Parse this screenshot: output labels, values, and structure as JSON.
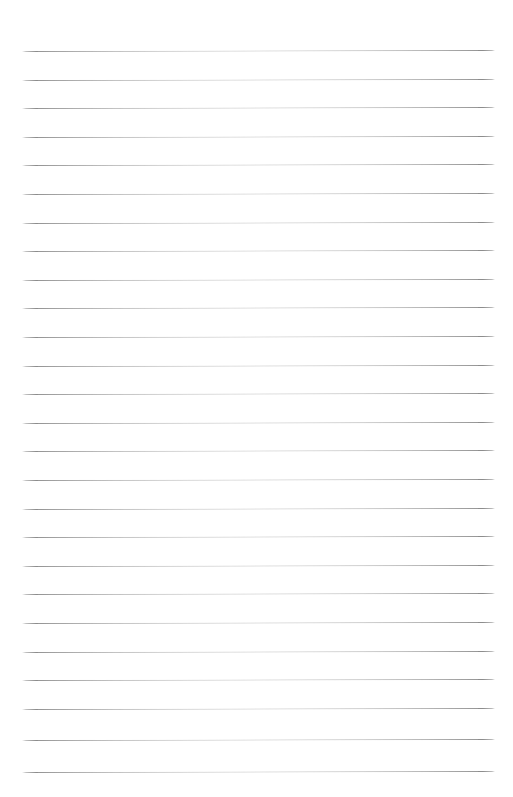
{
  "document": {
    "kind": "scanned-ruled-paper",
    "title": "Blank Ruled Notebook Page",
    "page_width": 513,
    "page_height": 797,
    "background_color": "#ffffff",
    "text_content": "",
    "has_handwriting": false,
    "has_printed_text": false,
    "has_margin_rule": false,
    "has_holes": false
  },
  "ruling": {
    "line_color": "#8d8d8d",
    "line_thickness_px": 1,
    "line_count": 26,
    "first_line_y": 51,
    "line_spacing_px": 28.6,
    "last_line_y": 772,
    "line_start_x": 22,
    "line_end_x": 495,
    "line_length_px": 473,
    "skew_degrees": -0.12,
    "lines": [
      {
        "index": 1,
        "y": 51,
        "x1": 22,
        "x2": 495
      },
      {
        "index": 2,
        "y": 79.6,
        "x1": 22,
        "x2": 495
      },
      {
        "index": 3,
        "y": 108.2,
        "x1": 22,
        "x2": 495
      },
      {
        "index": 4,
        "y": 136.8,
        "x1": 22,
        "x2": 495
      },
      {
        "index": 5,
        "y": 165.4,
        "x1": 22,
        "x2": 495
      },
      {
        "index": 6,
        "y": 194.0,
        "x1": 22,
        "x2": 495
      },
      {
        "index": 7,
        "y": 222.6,
        "x1": 22,
        "x2": 495
      },
      {
        "index": 8,
        "y": 251.2,
        "x1": 22,
        "x2": 495
      },
      {
        "index": 9,
        "y": 279.8,
        "x1": 22,
        "x2": 495
      },
      {
        "index": 10,
        "y": 308.4,
        "x1": 22,
        "x2": 495
      },
      {
        "index": 11,
        "y": 337.0,
        "x1": 22,
        "x2": 495
      },
      {
        "index": 12,
        "y": 365.6,
        "x1": 22,
        "x2": 495
      },
      {
        "index": 13,
        "y": 394.2,
        "x1": 22,
        "x2": 495
      },
      {
        "index": 14,
        "y": 422.8,
        "x1": 22,
        "x2": 495
      },
      {
        "index": 15,
        "y": 451.4,
        "x1": 22,
        "x2": 495
      },
      {
        "index": 16,
        "y": 480.0,
        "x1": 22,
        "x2": 495
      },
      {
        "index": 17,
        "y": 508.6,
        "x1": 22,
        "x2": 495
      },
      {
        "index": 18,
        "y": 537.2,
        "x1": 22,
        "x2": 495
      },
      {
        "index": 19,
        "y": 565.8,
        "x1": 22,
        "x2": 495
      },
      {
        "index": 20,
        "y": 594.4,
        "x1": 22,
        "x2": 495
      },
      {
        "index": 21,
        "y": 623.0,
        "x1": 22,
        "x2": 495
      },
      {
        "index": 22,
        "y": 651.6,
        "x1": 22,
        "x2": 495
      },
      {
        "index": 23,
        "y": 680.2,
        "x1": 22,
        "x2": 495
      },
      {
        "index": 24,
        "y": 708.8,
        "x1": 22,
        "x2": 495
      },
      {
        "index": 25,
        "y": 740.0,
        "x1": 22,
        "x2": 495
      },
      {
        "index": 26,
        "y": 772.0,
        "x1": 22,
        "x2": 495
      }
    ]
  }
}
